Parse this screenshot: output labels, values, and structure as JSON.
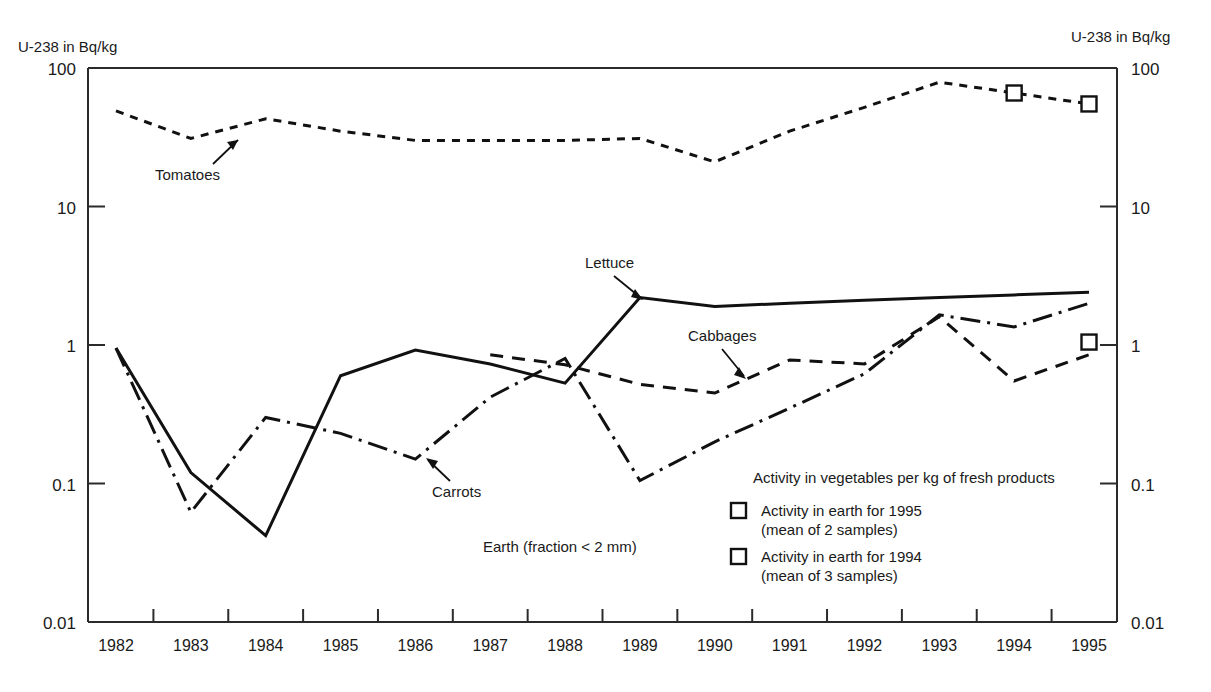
{
  "axes": {
    "y_unit_label_left": "U-238 in Bq/kg",
    "y_unit_label_right": "U-238 in Bq/kg",
    "y_ticks": [
      "100",
      "10",
      "1",
      "0.1",
      "0.01"
    ],
    "x_ticks": [
      "1982",
      "1983",
      "1984",
      "1985",
      "1986",
      "1987",
      "1988",
      "1989",
      "1990",
      "1991",
      "1992",
      "1993",
      "1994",
      "1995"
    ]
  },
  "annotations": {
    "tomatoes": "Tomatoes",
    "lettuce": "Lettuce",
    "cabbages": "Cabbages",
    "carrots": "Carrots",
    "earth_fraction": "Earth (fraction < 2 mm)"
  },
  "legend": {
    "header": "Activity in vegetables per kg of fresh products",
    "items": [
      {
        "label": "Activity in earth for 1995",
        "sub": "(mean of 2 samples)",
        "marker": "open-square"
      },
      {
        "label": "Activity in earth for 1994",
        "sub": "(mean of 3 samples)",
        "marker": "open-square"
      }
    ]
  },
  "colors": {
    "ink": "#111111",
    "axis": "#2b2b2b",
    "background": "#ffffff"
  },
  "chart_data": {
    "type": "line",
    "title": "",
    "xlabel": "",
    "ylabel": "U-238 in Bq/kg",
    "yscale": "log",
    "ylim": [
      0.01,
      100
    ],
    "grid": false,
    "legend_position": "inside-lower-right",
    "x": [
      1982,
      1983,
      1984,
      1985,
      1986,
      1987,
      1988,
      1989,
      1990,
      1991,
      1992,
      1993,
      1994,
      1995
    ],
    "series": [
      {
        "name": "Tomatoes",
        "style": "dotted",
        "x": [
          1982,
          1983,
          1984,
          1985,
          1986,
          1987,
          1988,
          1989,
          1990,
          1991,
          1992,
          1993,
          1994,
          1995
        ],
        "values": [
          49,
          31,
          43,
          35,
          30,
          30,
          30,
          31,
          21,
          35,
          52,
          79,
          66,
          55
        ]
      },
      {
        "name": "Lettuce",
        "style": "solid",
        "x": [
          1982,
          1983,
          1984,
          1985,
          1986,
          1987,
          1988,
          1989,
          1990,
          1991,
          1992,
          1993,
          1994,
          1995
        ],
        "values": [
          0.95,
          0.12,
          0.042,
          0.6,
          0.92,
          0.73,
          0.53,
          2.2,
          1.9,
          2.0,
          2.1,
          2.2,
          2.3,
          2.4
        ]
      },
      {
        "name": "Cabbages",
        "style": "dashed",
        "x": [
          1987,
          1988,
          1989,
          1990,
          1991,
          1992,
          1993,
          1994,
          1995
        ],
        "values": [
          0.85,
          0.72,
          0.52,
          0.45,
          0.78,
          0.73,
          1.6,
          0.55,
          0.85
        ]
      },
      {
        "name": "Carrots",
        "style": "dash-dot",
        "x": [
          1982,
          1983,
          1984,
          1985,
          1986,
          1987,
          1988,
          1989,
          1990,
          1991,
          1992,
          1993,
          1994,
          1995
        ],
        "values": [
          0.95,
          0.062,
          0.3,
          0.23,
          0.15,
          0.42,
          0.8,
          0.105,
          0.2,
          0.35,
          0.62,
          1.65,
          1.35,
          2.0
        ]
      }
    ],
    "point_markers": [
      {
        "name": "earth-1994-upper",
        "x": 1994,
        "y": 66,
        "marker": "open-square"
      },
      {
        "name": "earth-1995-upper",
        "x": 1995,
        "y": 55,
        "marker": "open-square"
      },
      {
        "name": "earth-1995-lower",
        "x": 1995,
        "y": 1.05,
        "marker": "open-square"
      }
    ]
  }
}
